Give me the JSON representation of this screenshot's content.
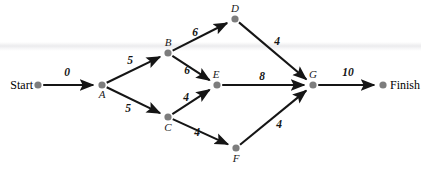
{
  "diagram": {
    "type": "activity-network-diagram",
    "title": "",
    "background_color": "#ffffff",
    "node_color": "#7d7d7d",
    "edge_color": "#151515",
    "label_color": "#141414",
    "terminals": {
      "start_label": "Start",
      "finish_label": "Finish"
    },
    "nodes": [
      {
        "id": "start",
        "label": "",
        "x": 38,
        "y": 85,
        "label_dx": 0,
        "label_dy": 0,
        "show_label": false
      },
      {
        "id": "A",
        "label": "A",
        "x": 102,
        "y": 85,
        "label_dx": 0,
        "label_dy": 13,
        "show_label": true
      },
      {
        "id": "B",
        "label": "B",
        "x": 168,
        "y": 53,
        "label_dx": 0,
        "label_dy": -7,
        "show_label": true
      },
      {
        "id": "C",
        "label": "C",
        "x": 168,
        "y": 117,
        "label_dx": 0,
        "label_dy": 14,
        "show_label": true
      },
      {
        "id": "D",
        "label": "D",
        "x": 235,
        "y": 19,
        "label_dx": 0,
        "label_dy": -7,
        "show_label": true
      },
      {
        "id": "E",
        "label": "E",
        "x": 217,
        "y": 85,
        "label_dx": -1,
        "label_dy": -7,
        "show_label": true
      },
      {
        "id": "F",
        "label": "F",
        "x": 236,
        "y": 148,
        "label_dx": 0,
        "label_dy": 14,
        "show_label": true
      },
      {
        "id": "G",
        "label": "G",
        "x": 313,
        "y": 85,
        "label_dx": 0,
        "label_dy": -7,
        "show_label": true
      },
      {
        "id": "finish",
        "label": "",
        "x": 383,
        "y": 85,
        "label_dx": 0,
        "label_dy": 0,
        "show_label": false
      }
    ],
    "edges": [
      {
        "id": "start-A",
        "from": "start",
        "to": "A",
        "weight": "0",
        "lx": 67,
        "ly": 76
      },
      {
        "id": "A-B",
        "from": "A",
        "to": "B",
        "weight": "5",
        "lx": 130,
        "ly": 64
      },
      {
        "id": "A-C",
        "from": "A",
        "to": "C",
        "weight": "5",
        "lx": 128,
        "ly": 112
      },
      {
        "id": "B-D",
        "from": "B",
        "to": "D",
        "weight": "6",
        "lx": 195,
        "ly": 36
      },
      {
        "id": "B-E",
        "from": "B",
        "to": "E",
        "weight": "6",
        "lx": 187,
        "ly": 74
      },
      {
        "id": "C-E",
        "from": "C",
        "to": "E",
        "weight": "4",
        "lx": 186,
        "ly": 101
      },
      {
        "id": "C-F",
        "from": "C",
        "to": "F",
        "weight": "4",
        "lx": 197,
        "ly": 136
      },
      {
        "id": "D-G",
        "from": "D",
        "to": "G",
        "weight": "4",
        "lx": 277,
        "ly": 45
      },
      {
        "id": "E-G",
        "from": "E",
        "to": "G",
        "weight": "8",
        "lx": 262,
        "ly": 80
      },
      {
        "id": "F-G",
        "from": "F",
        "to": "G",
        "weight": "4",
        "lx": 279,
        "ly": 128
      },
      {
        "id": "G-finish",
        "from": "G",
        "to": "finish",
        "weight": "10",
        "lx": 348,
        "ly": 76
      }
    ]
  }
}
